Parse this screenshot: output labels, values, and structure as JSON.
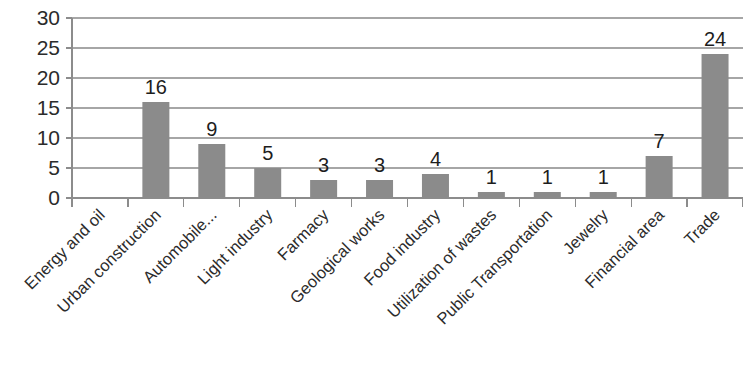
{
  "chart_data": {
    "type": "bar",
    "title": "",
    "subtitle": "",
    "xlabel": "",
    "ylabel": "",
    "ylim": [
      0,
      30
    ],
    "yticks": [
      0,
      5,
      10,
      15,
      20,
      25,
      30
    ],
    "grid": true,
    "legend": null,
    "legend_position": "none",
    "bar_color": "#8b8b8b",
    "gridline_color": "#a6a6a6",
    "axis_color": "#8c8c8c",
    "text_color": "#2b2b2b",
    "x_tick_label_rotation": 45,
    "categories": [
      "Energy and oil",
      "Urban construction",
      "Automobile...",
      "Light industry",
      "Farmacy",
      "Geological works",
      "Food industry",
      "Utilization of wastes",
      "Public Transportation",
      "Jewelry",
      "Financial area",
      "Trade"
    ],
    "values": [
      0,
      16,
      9,
      5,
      3,
      3,
      4,
      1,
      1,
      1,
      7,
      24
    ],
    "data_labels": [
      "",
      "16",
      "9",
      "5",
      "3",
      "3",
      "4",
      "1",
      "1",
      "1",
      "7",
      "24"
    ]
  }
}
